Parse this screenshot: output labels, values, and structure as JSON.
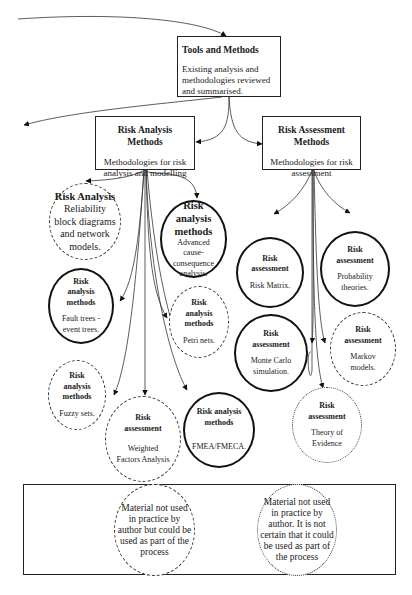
{
  "diagram": {
    "top_box": {
      "title": "Tools and Methods",
      "description": "Existing analysis and methodologies reviewed and summarised."
    },
    "branches": [
      {
        "title": "Risk Analysis Methods",
        "description": "Methodologies for risk analysis and  modelling"
      },
      {
        "title": "Risk Assessment Methods",
        "description": "Methodologies for risk assessment"
      }
    ],
    "nodes": [
      {
        "id": "reliability-block",
        "title": "Risk Analysis",
        "description": "Reliability block diagrams and network models.",
        "style": "dashed"
      },
      {
        "id": "cause-consequence",
        "title": "Risk analysis methods",
        "description": "Advanced cause-consequence analysis.",
        "style": "solid"
      },
      {
        "id": "fault-trees",
        "title": "Risk analysis methods",
        "description": "Fault trees - event trees.",
        "style": "solid"
      },
      {
        "id": "petri-nets",
        "title": "Risk analysis methods",
        "description": "Petri nets.",
        "style": "dashed"
      },
      {
        "id": "fuzzy-sets",
        "title": "Risk analysis methods",
        "description": "Fuzzy sets.",
        "style": "dashed"
      },
      {
        "id": "weighted-factors",
        "title": "Risk assessment",
        "description": "Weighted Factors Analysis",
        "style": "dashed"
      },
      {
        "id": "fmea",
        "title": "Risk analysis methods",
        "description": "FMEA/FMECA.",
        "style": "solid"
      },
      {
        "id": "risk-matrix",
        "title": "Risk assessment",
        "description": "Risk Matrix.",
        "style": "solid"
      },
      {
        "id": "probability",
        "title": "Risk assessment",
        "description": "Probability theories.",
        "style": "solid"
      },
      {
        "id": "monte-carlo",
        "title": "Risk assessment",
        "description": "Monte Carlo simulation.",
        "style": "solid"
      },
      {
        "id": "markov",
        "title": "Risk assessment",
        "description": "Markov models.",
        "style": "dashed"
      },
      {
        "id": "theory-of-evidence",
        "title": "Risk assessment",
        "description": "Theory of Evidence",
        "style": "dotted"
      }
    ],
    "legend": [
      {
        "style": "dashed",
        "text": "Material not used in practice by author but could be used as part of the process"
      },
      {
        "style": "dotted",
        "text": "Material not used in practice by author. It is not certain that it could be used as part of the process"
      }
    ],
    "colors": {
      "line": "#222222",
      "background": "#ffffff"
    }
  }
}
